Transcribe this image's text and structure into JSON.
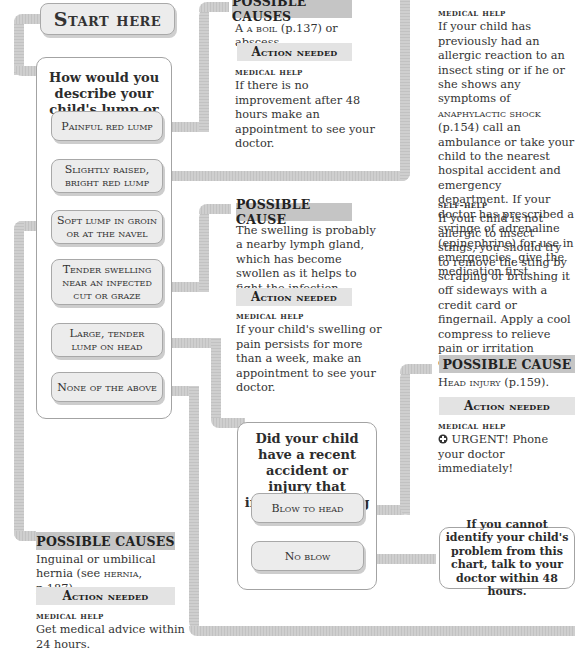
{
  "start": {
    "label": "Start here"
  },
  "question1": {
    "text": "How would you describe your child's lump or swelling?",
    "options": [
      {
        "label": "Painful red lump"
      },
      {
        "label": "Slightly raised, bright red lump"
      },
      {
        "label": "Soft lump in groin or at the navel"
      },
      {
        "label": "Tender swelling near an infected cut or graze"
      },
      {
        "label": "Large, tender lump on head"
      },
      {
        "label": "None of the above"
      }
    ]
  },
  "result_boil": {
    "header": "POSSIBLE CAUSES",
    "cause_link": "a boil",
    "cause_rest": " (p.137) or abscess.",
    "cause_prefix": "A ",
    "action_header": "Action needed",
    "help_label": "medical help",
    "help_text": "If there is no improvement after 48 hours make an appointment to see your doctor."
  },
  "result_sting": {
    "help_label": "medical help",
    "help_text_1": "If your child has previously had an allergic reaction to an insect sting or if he or she shows any symptoms of ",
    "help_link": "anaphylactic shock",
    "help_text_2": " (p.154) call an ambulance or take your child to the nearest hospital accident and emergency department. If your doctor has prescribed a syringe of adrenaline (epinephrine) for use in emergencies, give the medication first.",
    "self_label": "self-help",
    "self_text": "If your child is not allergic to insect stings, you should try to remove the sting by scraping or brushing it off sideways with a credit card or fingernail. Apply a cool compress to relieve pain or irritation caused by the sting."
  },
  "result_lymph": {
    "header": "POSSIBLE CAUSE",
    "cause_text": "The swelling is probably a nearby lymph gland, which has become swollen as it helps to fight the infection.",
    "action_header": "Action needed",
    "help_label": "medical help",
    "help_text": "If your child's swelling or pain persists for more than a week, make an appointment to see your doctor."
  },
  "result_head": {
    "header": "POSSIBLE CAUSE",
    "cause_link": "Head injury",
    "cause_rest": " (p.159).",
    "action_header": "Action needed",
    "help_label": "medical help",
    "urgent_icon": "urgent-cross-icon",
    "help_text": "URGENT! Phone your doctor immediately!"
  },
  "result_hernia": {
    "header": "POSSIBLE CAUSES",
    "cause_text_1": "Inguinal or umbilical hernia (see ",
    "cause_link": "hernia",
    "cause_text_2": ", p.187).",
    "action_header": "Action needed",
    "help_label": "medical help",
    "help_text": "Get medical advice within 24 hours."
  },
  "question2": {
    "text": "Did your child have a recent accident or injury that involved banging the head?",
    "options": [
      {
        "label": "Blow to head"
      },
      {
        "label": "No blow"
      }
    ]
  },
  "final": {
    "text": "If you cannot identify your child's problem from this chart, talk to your doctor within 48 hours."
  },
  "colors": {
    "pipe": "#c9c9c9",
    "header_dark": "#c5c5c5",
    "header_light": "#e3e3e3",
    "option_fill": "#ececec",
    "border": "#a8a8a8"
  }
}
